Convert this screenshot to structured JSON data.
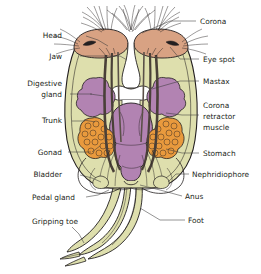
{
  "figure": {
    "background": "#ffffff"
  },
  "colors": {
    "corona_cap": "#d8a283",
    "trunk_body": "#dedfad",
    "organ_mauve": "#b283b2",
    "stomach_mauve": "#b283b2",
    "gonad_orange": "#e99a3d",
    "outline": "#231f20",
    "leader_line": "#3a3a3a",
    "label_text": "#231f20"
  },
  "labels_left": [
    {
      "id": "head",
      "text": "Head",
      "x": 62,
      "y": 38
    },
    {
      "id": "jaw",
      "text": "Jaw",
      "x": 62,
      "y": 59
    },
    {
      "id": "digestive-gland-line1",
      "text": "Digestive",
      "x": 62,
      "y": 86
    },
    {
      "id": "digestive-gland-line2",
      "text": "gland",
      "x": 62,
      "y": 97
    },
    {
      "id": "trunk",
      "text": "Trunk",
      "x": 62,
      "y": 123
    },
    {
      "id": "gonad",
      "text": "Gonad",
      "x": 62,
      "y": 155
    },
    {
      "id": "bladder",
      "text": "Bladder",
      "x": 62,
      "y": 177
    },
    {
      "id": "pedal-gland",
      "text": "Pedal gland",
      "x": 75,
      "y": 200
    },
    {
      "id": "gripping-toe",
      "text": "Gripping toe",
      "x": 78,
      "y": 224
    }
  ],
  "labels_right": [
    {
      "id": "corona",
      "text": "Corona",
      "x": 200,
      "y": 24
    },
    {
      "id": "eye-spot",
      "text": "Eye spot",
      "x": 203,
      "y": 62
    },
    {
      "id": "mastax",
      "text": "Mastax",
      "x": 203,
      "y": 84
    },
    {
      "id": "corona-retractor-line1",
      "text": "Corona",
      "x": 203,
      "y": 108
    },
    {
      "id": "corona-retractor-line2",
      "text": "retractor",
      "x": 203,
      "y": 119
    },
    {
      "id": "corona-retractor-line3",
      "text": "muscle",
      "x": 203,
      "y": 130
    },
    {
      "id": "stomach",
      "text": "Stomach",
      "x": 203,
      "y": 156
    },
    {
      "id": "nephridiophore",
      "text": "Nephridiophore",
      "x": 192,
      "y": 177
    },
    {
      "id": "anus",
      "text": "Anus",
      "x": 185,
      "y": 199
    },
    {
      "id": "foot",
      "text": "Foot",
      "x": 188,
      "y": 223
    }
  ],
  "parts": [
    {
      "id": "corona",
      "name": "Corona",
      "color": "#d8a283"
    },
    {
      "id": "trunk",
      "name": "Trunk",
      "color": "#dedfad"
    },
    {
      "id": "digestive-gland",
      "name": "Digestive gland",
      "color": "#b283b2"
    },
    {
      "id": "stomach",
      "name": "Stomach",
      "color": "#b283b2"
    },
    {
      "id": "gonad",
      "name": "Gonad",
      "color": "#e99a3d"
    },
    {
      "id": "foot",
      "name": "Foot",
      "color": "#dedfad"
    }
  ]
}
